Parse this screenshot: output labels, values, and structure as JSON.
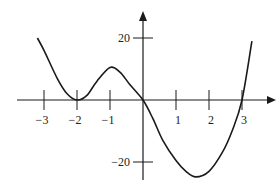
{
  "chart_data": {
    "type": "line",
    "title": "",
    "xlabel": "",
    "ylabel": "",
    "x_ticks": [
      -3,
      -2,
      -1,
      1,
      2,
      3
    ],
    "x_tick_labels": [
      "−3",
      "−2",
      "−1",
      "1",
      "2",
      "3"
    ],
    "y_ticks": [
      20,
      -20
    ],
    "y_tick_labels": [
      "20",
      "−20"
    ],
    "xlim": [
      -3.3,
      3.3
    ],
    "ylim": [
      -25,
      28
    ],
    "grid": false,
    "legend": null,
    "series": [
      {
        "name": "f(x)",
        "x": [
          -3.2,
          -3.0,
          -2.6,
          -2.3,
          -2.0,
          -1.7,
          -1.4,
          -1.0,
          -0.7,
          -0.4,
          0.0,
          0.3,
          0.6,
          1.0,
          1.3,
          1.6,
          2.0,
          2.4,
          2.7,
          3.0,
          3.3
        ],
        "y": [
          20,
          16,
          7,
          2,
          0,
          1.5,
          6,
          10.5,
          9,
          5,
          0,
          -6,
          -13,
          -19.5,
          -23,
          -24.8,
          -23,
          -17,
          -10,
          0,
          19
        ]
      }
    ]
  },
  "axes": {
    "color": "#1a1a1a"
  }
}
